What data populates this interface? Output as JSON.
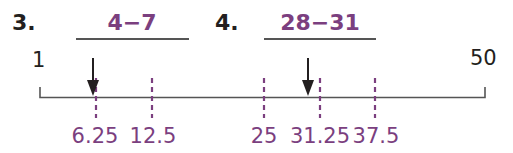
{
  "questions": [
    {
      "number": "3.",
      "answer": "4−7"
    },
    {
      "number": "4.",
      "answer": "28−31"
    }
  ],
  "number_line": {
    "start_label": "1",
    "end_label": "50",
    "ticks": [
      {
        "value": 6.25,
        "label": "6.25"
      },
      {
        "value": 12.5,
        "label": "12.5"
      },
      {
        "value": 25,
        "label": "25"
      },
      {
        "value": 31.25,
        "label": "31.25"
      },
      {
        "value": 37.5,
        "label": "37.5"
      }
    ],
    "arrows": [
      6.25,
      30
    ],
    "colors": {
      "line": "#555555",
      "ticks": "#7b3f7f",
      "arrow": "#231f20"
    }
  }
}
